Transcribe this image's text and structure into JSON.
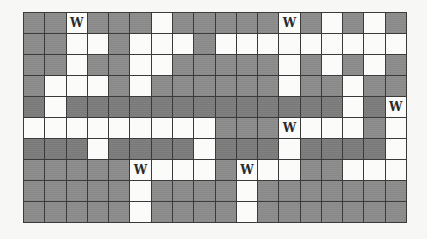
{
  "grid": {
    "columns": 18,
    "rows": 10,
    "legend": {
      "G": "gray",
      ".": "white",
      "W": "white-with-W"
    },
    "marker_label": "W",
    "colors": {
      "gray": "#8d8d8d",
      "white": "#fbfbfa",
      "line": "#3a3a3a"
    },
    "cells": [
      [
        "G",
        "G",
        "W",
        "G",
        "G",
        "G",
        ".",
        "G",
        "G",
        "G",
        "G",
        "G",
        "W",
        "G",
        ".",
        "G",
        ".",
        "G"
      ],
      [
        "G",
        "G",
        ".",
        ".",
        "G",
        ".",
        ".",
        ".",
        "G",
        ".",
        ".",
        ".",
        ".",
        ".",
        ".",
        ".",
        ".",
        "."
      ],
      [
        "G",
        "G",
        ".",
        "G",
        "G",
        ".",
        ".",
        "G",
        "G",
        "G",
        "G",
        "G",
        ".",
        "G",
        ".",
        "G",
        ".",
        "G"
      ],
      [
        "G",
        ".",
        ".",
        ".",
        "G",
        ".",
        "G",
        "G",
        "G",
        "G",
        "G",
        "G",
        ".",
        "G",
        "G",
        ".",
        "G",
        "G"
      ],
      [
        "G",
        ".",
        "G",
        "G",
        "G",
        "G",
        "G",
        "G",
        "G",
        "G",
        "G",
        "G",
        "G",
        "G",
        "G",
        ".",
        "G",
        "W"
      ],
      [
        ".",
        ".",
        ".",
        ".",
        ".",
        ".",
        ".",
        ".",
        ".",
        "G",
        "G",
        "G",
        "W",
        ".",
        ".",
        ".",
        "G",
        "."
      ],
      [
        "G",
        "G",
        "G",
        ".",
        "G",
        "G",
        "G",
        "G",
        ".",
        "G",
        "G",
        "G",
        ".",
        "G",
        "G",
        "G",
        "G",
        "."
      ],
      [
        "G",
        "G",
        "G",
        "G",
        "G",
        "W",
        ".",
        ".",
        ".",
        "G",
        "W",
        ".",
        ".",
        "G",
        "G",
        ".",
        ".",
        "."
      ],
      [
        "G",
        "G",
        "G",
        "G",
        "G",
        ".",
        "G",
        "G",
        "G",
        "G",
        ".",
        "G",
        "G",
        "G",
        "G",
        "G",
        "G",
        "G"
      ],
      [
        "G",
        "G",
        "G",
        "G",
        "G",
        ".",
        "G",
        "G",
        "G",
        "G",
        ".",
        "G",
        "G",
        "G",
        "G",
        "G",
        "G",
        "G"
      ]
    ]
  }
}
